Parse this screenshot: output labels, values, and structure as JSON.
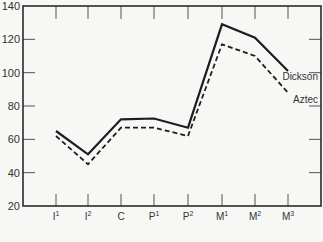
{
  "chart_data": {
    "type": "line",
    "title": "",
    "xlabel": "",
    "ylabel": "",
    "categories": [
      {
        "base": "I",
        "sup": "1"
      },
      {
        "base": "I",
        "sup": "2"
      },
      {
        "base": "C",
        "sup": ""
      },
      {
        "base": "P",
        "sup": "1"
      },
      {
        "base": "P",
        "sup": "2"
      },
      {
        "base": "M",
        "sup": "1"
      },
      {
        "base": "M",
        "sup": "2"
      },
      {
        "base": "M",
        "sup": "3"
      }
    ],
    "series": [
      {
        "name": "Dickson",
        "style": "solid",
        "values": [
          65,
          51,
          72,
          72.5,
          67,
          129,
          121,
          101
        ]
      },
      {
        "name": "Aztec",
        "style": "dashed",
        "values": [
          62,
          45,
          67,
          67,
          62,
          117,
          110,
          88
        ]
      }
    ],
    "ylim": [
      20,
      140
    ],
    "yticks": [
      20,
      40,
      60,
      80,
      100,
      120,
      140
    ],
    "grid": false,
    "legend": "inline-right",
    "line_color": "#1e1e1e"
  }
}
